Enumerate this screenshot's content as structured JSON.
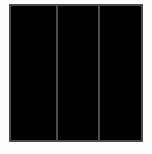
{
  "figure": {
    "name": "three-panel-rectangle",
    "canvas": {
      "width": 152,
      "height": 154,
      "background_color": "#fdfdfd"
    },
    "stroke": {
      "color": "#4a4d50",
      "width": 2,
      "linecap": "square",
      "linejoin": "miter"
    },
    "outer_rect": {
      "x": 10,
      "y": 5,
      "width": 132,
      "height": 136,
      "fill_color": "#ffffff"
    },
    "dividers": [
      {
        "label": "divider-1",
        "x": 56.5,
        "y_top": 5,
        "y_bottom": 141
      },
      {
        "label": "divider-2",
        "x": 98.5,
        "y_top": 5,
        "y_bottom": 141
      }
    ],
    "panels": [
      {
        "label": "panel-left",
        "x": 11,
        "y": 6,
        "width": 44.5,
        "height": 134
      },
      {
        "label": "panel-middle",
        "x": 57.5,
        "y": 6,
        "width": 40,
        "height": 134
      },
      {
        "label": "panel-right",
        "x": 99.5,
        "y": 6,
        "width": 41.5,
        "height": 134
      }
    ]
  }
}
